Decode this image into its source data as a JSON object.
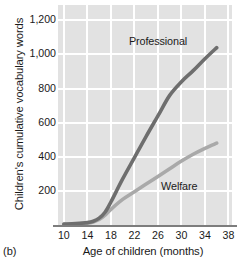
{
  "panel": {
    "caption": "(b)"
  },
  "chart_data": {
    "type": "line",
    "title": "",
    "xlabel": "Age of children (months)",
    "ylabel": "Children's cumulative vocabulary words",
    "xlim": [
      9,
      38.6
    ],
    "ylim": [
      0,
      1290
    ],
    "xticks": [
      10,
      14,
      18,
      22,
      26,
      30,
      34,
      38
    ],
    "xtick_labels": [
      "10",
      "14",
      "18",
      "22",
      "26",
      "30",
      "34",
      "38"
    ],
    "yticks": [
      200,
      400,
      600,
      800,
      1000,
      1200
    ],
    "ytick_labels": [
      "200",
      "400",
      "600",
      "800",
      "1,000",
      "1,200"
    ],
    "grid": true,
    "grid_color": "#ffffff",
    "plot_background": "#e2e2e2",
    "axis_color": "#7d7d7d",
    "legend_position": "inline-annotations",
    "series": [
      {
        "name": "Professional",
        "color": "#6e6e6e",
        "label_x": 26.0,
        "label_y": 1075,
        "x": [
          10,
          12,
          14,
          15,
          16,
          17,
          18,
          20,
          22,
          24,
          26,
          28,
          30,
          32,
          34,
          36
        ],
        "values": [
          5,
          8,
          14,
          22,
          40,
          75,
          135,
          270,
          395,
          520,
          640,
          760,
          840,
          905,
          975,
          1040
        ]
      },
      {
        "name": "Welfare",
        "color": "#a9a9a9",
        "label_x": 29.6,
        "label_y": 225,
        "x": [
          10,
          12,
          14,
          15,
          16,
          17,
          18,
          20,
          22,
          24,
          26,
          28,
          30,
          32,
          34,
          36
        ],
        "values": [
          4,
          6,
          11,
          18,
          32,
          58,
          92,
          150,
          195,
          240,
          285,
          330,
          375,
          415,
          450,
          480
        ]
      }
    ],
    "annotations": [
      {
        "text": "Professional",
        "series": "Professional"
      },
      {
        "text": "Welfare",
        "series": "Welfare"
      }
    ]
  }
}
